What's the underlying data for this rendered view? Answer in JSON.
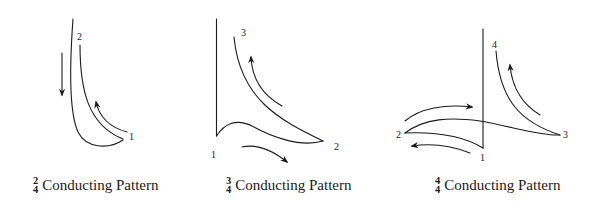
{
  "diagrams": [
    {
      "id": "two-four",
      "time_signature": {
        "numerator": "2",
        "denominator": "4"
      },
      "caption": "Conducting Pattern",
      "beat_labels": [
        "1",
        "2"
      ]
    },
    {
      "id": "three-four",
      "time_signature": {
        "numerator": "3",
        "denominator": "4"
      },
      "caption": "Conducting Pattern",
      "beat_labels": [
        "1",
        "2",
        "3"
      ]
    },
    {
      "id": "four-four",
      "time_signature": {
        "numerator": "4",
        "denominator": "4"
      },
      "caption": "Conducting Pattern",
      "beat_labels": [
        "1",
        "2",
        "3",
        "4"
      ]
    }
  ],
  "colors": {
    "ink": "#1a1a1a",
    "background": "#ffffff"
  }
}
